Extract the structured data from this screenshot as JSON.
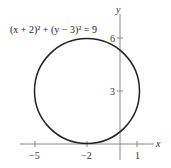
{
  "diagram": {
    "equation": "(x + 2)² + (y − 3)² = 9",
    "axes": {
      "x_label": "x",
      "y_label": "y",
      "x_ticks": [
        "−5",
        "−2",
        "1"
      ],
      "y_ticks": [
        "6",
        "3"
      ]
    },
    "circle": {
      "center": [
        -2,
        3
      ],
      "radius": 3
    },
    "colors": {
      "axis": "#888888",
      "curve": "#222222"
    }
  }
}
